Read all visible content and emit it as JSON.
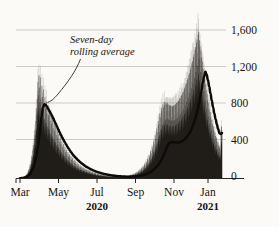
{
  "figure": {
    "background_color": "#fbfaf7",
    "ink_color": "#17140f",
    "gridline_color": "#b9b4a8"
  },
  "annotation": {
    "line1": "Seven-day",
    "line2": "rolling average"
  },
  "chart_data": {
    "type": "bar",
    "title": "",
    "subtitle": "",
    "xlabel": "",
    "ylabel": "",
    "grid": true,
    "legend": "none",
    "ylim": [
      0,
      1750
    ],
    "yticks": [
      0,
      400,
      800,
      1200,
      1600
    ],
    "ytick_labels": [
      "0",
      "400",
      "800",
      "1,200",
      "1,600"
    ],
    "xtick_labels": [
      "Mar",
      "May",
      "Jul",
      "Sep",
      "Nov",
      "Jan"
    ],
    "xtick_positions_weeks": [
      0,
      8.7,
      17.4,
      26.1,
      34.8,
      43.5
    ],
    "year_labels": [
      {
        "text": "2020",
        "at_tick": "Jul"
      },
      {
        "text": "2021",
        "at_tick": "Jan"
      }
    ],
    "annotations": [
      {
        "text": "Seven-day rolling average",
        "points_to": {
          "x_label": "mid-April 2020",
          "y_value": 800
        }
      }
    ],
    "series": [
      {
        "name": "Daily reported deaths",
        "type": "bar",
        "values": [
          2,
          3,
          5,
          4,
          8,
          7,
          12,
          10,
          18,
          16,
          26,
          31,
          24,
          40,
          55,
          48,
          72,
          95,
          80,
          120,
          150,
          135,
          190,
          240,
          215,
          300,
          360,
          330,
          430,
          520,
          470,
          620,
          760,
          700,
          860,
          1040,
          900,
          1110,
          980,
          820,
          1090,
          860,
          760,
          1000,
          880,
          690,
          960,
          800,
          640,
          880,
          760,
          600,
          830,
          700,
          560,
          790,
          680,
          530,
          730,
          620,
          480,
          690,
          590,
          450,
          640,
          540,
          420,
          600,
          510,
          390,
          560,
          470,
          360,
          520,
          440,
          340,
          480,
          400,
          310,
          440,
          370,
          280,
          400,
          340,
          260,
          370,
          310,
          240,
          340,
          285,
          220,
          310,
          260,
          200,
          285,
          240,
          185,
          260,
          220,
          170,
          240,
          200,
          155,
          220,
          185,
          140,
          200,
          170,
          130,
          185,
          155,
          120,
          170,
          140,
          110,
          155,
          130,
          100,
          140,
          120,
          92,
          130,
          110,
          85,
          120,
          100,
          78,
          110,
          92,
          72,
          100,
          85,
          65,
          92,
          78,
          60,
          85,
          72,
          55,
          78,
          65,
          50,
          72,
          60,
          46,
          65,
          55,
          42,
          60,
          50,
          38,
          55,
          46,
          36,
          50,
          42,
          32,
          46,
          38,
          30,
          42,
          36,
          28,
          38,
          32,
          25,
          36,
          30,
          23,
          32,
          28,
          22,
          30,
          26,
          20,
          28,
          24,
          19,
          26,
          22,
          18,
          25,
          21,
          17,
          24,
          20,
          16,
          23,
          20,
          16,
          22,
          19,
          15,
          22,
          19,
          15,
          22,
          19,
          15,
          23,
          20,
          16,
          24,
          21,
          17,
          26,
          23,
          18,
          28,
          25,
          20,
          31,
          27,
          22,
          35,
          31,
          25,
          39,
          35,
          28,
          45,
          40,
          32,
          52,
          46,
          37,
          60,
          54,
          43,
          70,
          63,
          50,
          82,
          74,
          59,
          96,
          87,
          69,
          112,
          102,
          81,
          132,
          120,
          95,
          155,
          141,
          112,
          182,
          166,
          132,
          213,
          195,
          155,
          250,
          229,
          182,
          293,
          268,
          213,
          342,
          314,
          250,
          400,
          367,
          292,
          466,
          428,
          341,
          540,
          500,
          398,
          620,
          580,
          462,
          700,
          660,
          527,
          760,
          724,
          578,
          800,
          768,
          614,
          820,
          793,
          635,
          825,
          802,
          642,
          815,
          796,
          638,
          800,
          784,
          628,
          790,
          778,
          624,
          785,
          776,
          622,
          790,
          784,
          629,
          800,
          798,
          640,
          815,
          817,
          656,
          835,
          840,
          675,
          860,
          868,
          698,
          890,
          900,
          724,
          925,
          938,
          755,
          965,
          980,
          790,
          1010,
          1028,
          829,
          1060,
          1080,
          872,
          1115,
          1137,
          919,
          1175,
          1199,
          970,
          1240,
          1266,
          1025,
          1310,
          1338,
          1084,
          1385,
          1415,
          1148,
          1465,
          1497,
          1216,
          1550,
          1584,
          1289,
          1490,
          1420,
          1150,
          1380,
          1300,
          1040,
          1260,
          1180,
          940,
          1140,
          1060,
          845,
          1020,
          950,
          755,
          910,
          845,
          672,
          810,
          750,
          596,
          718,
          664,
          528,
          636,
          588,
          467,
          562,
          519,
          413,
          496,
          458,
          364,
          438,
          404,
          321,
          387,
          357,
          284,
          342,
          315,
          251,
          520,
          560,
          495
        ]
      },
      {
        "name": "Seven-day rolling average",
        "type": "line",
        "values": [
          3,
          4,
          6,
          9,
          13,
          19,
          27,
          38,
          53,
          74,
          102,
          140,
          190,
          255,
          338,
          440,
          560,
          672,
          762,
          800,
          795,
          775,
          752,
          728,
          703,
          676,
          648,
          618,
          588,
          557,
          527,
          498,
          470,
          443,
          417,
          392,
          368,
          345,
          323,
          303,
          283,
          265,
          248,
          232,
          217,
          203,
          190,
          177,
          166,
          155,
          145,
          135,
          126,
          118,
          110,
          103,
          96,
          90,
          84,
          78,
          73,
          68,
          64,
          60,
          56,
          52,
          49,
          46,
          43,
          40,
          38,
          35,
          33,
          31,
          29,
          28,
          26,
          25,
          24,
          23,
          22,
          21,
          21,
          20,
          20,
          20,
          20,
          21,
          21,
          22,
          23,
          24,
          26,
          28,
          30,
          33,
          36,
          40,
          44,
          49,
          55,
          62,
          70,
          79,
          89,
          101,
          114,
          129,
          146,
          165,
          187,
          211,
          239,
          270,
          305,
          344,
          368,
          382,
          390,
          393,
          392,
          390,
          388,
          387,
          388,
          391,
          396,
          403,
          412,
          424,
          438,
          455,
          475,
          499,
          527,
          560,
          598,
          641,
          690,
          745,
          806,
          874,
          949,
          1032,
          1100,
          1150,
          1120,
          1060,
          990,
          915,
          840,
          768,
          700,
          638,
          582,
          532,
          488,
          480,
          490
        ]
      }
    ],
    "notes": {
      "x_span": "Mar 2020 through mid-Feb 2021",
      "peak_first_wave_average": 800,
      "peak_second_wave_average": 1150,
      "trough_average": 20
    }
  }
}
